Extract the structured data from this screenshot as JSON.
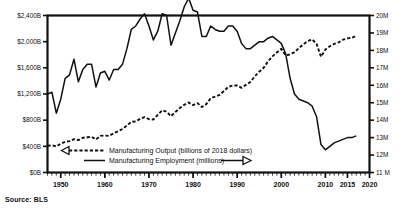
{
  "figure": {
    "source_note": "Source: BLS"
  },
  "chart_data": {
    "type": "line",
    "title": "",
    "xlabel": "",
    "ylabel": "",
    "grid": false,
    "legend_position": "inside-bottom",
    "xlim": [
      1947,
      2020
    ],
    "x_ticks": [
      "1950",
      "1960",
      "1970",
      "1980",
      "1990",
      "2000",
      "2010",
      "2015",
      "2020"
    ],
    "x_tick_values": [
      1950,
      1960,
      1970,
      1980,
      1990,
      2000,
      2010,
      2015,
      2020
    ],
    "minor_x_tick_interval": 1,
    "axes": [
      {
        "id": "left",
        "label_suffix": "B",
        "ylim": [
          0,
          2400
        ],
        "ticks": [
          "$0B",
          "$400B",
          "$800B",
          "$1,200B",
          "$1,600B",
          "$2,000B",
          "$2,400B"
        ],
        "tick_values": [
          0,
          400,
          800,
          1200,
          1600,
          2000,
          2400
        ]
      },
      {
        "id": "right",
        "label_suffix": "M",
        "ylim": [
          11,
          20
        ],
        "ticks": [
          "11 M",
          "12M",
          "13M",
          "14M",
          "15M",
          "16M",
          "17M",
          "18M",
          "19M",
          "20M"
        ],
        "tick_values": [
          11,
          12,
          13,
          14,
          15,
          16,
          17,
          18,
          19,
          20
        ]
      }
    ],
    "series": [
      {
        "name": "Manufacturing Output (billions of 2018 dollars)",
        "axis": "left",
        "style": "dashed",
        "arrow": "left",
        "x": [
          1947,
          1948,
          1949,
          1950,
          1951,
          1952,
          1953,
          1954,
          1955,
          1956,
          1957,
          1958,
          1959,
          1960,
          1961,
          1962,
          1963,
          1964,
          1965,
          1966,
          1967,
          1968,
          1969,
          1970,
          1971,
          1972,
          1973,
          1974,
          1975,
          1976,
          1977,
          1978,
          1979,
          1980,
          1981,
          1982,
          1983,
          1984,
          1985,
          1986,
          1987,
          1988,
          1989,
          1990,
          1991,
          1992,
          1993,
          1994,
          1995,
          1996,
          1997,
          1998,
          1999,
          2000,
          2001,
          2002,
          2003,
          2004,
          2005,
          2006,
          2007,
          2008,
          2009,
          2010,
          2011,
          2012,
          2013,
          2014,
          2015,
          2016,
          2017
        ],
        "values": [
          410,
          415,
          400,
          440,
          470,
          480,
          510,
          495,
          530,
          540,
          545,
          505,
          560,
          565,
          560,
          600,
          630,
          665,
          720,
          775,
          780,
          820,
          845,
          815,
          810,
          880,
          950,
          930,
          860,
          925,
          985,
          1035,
          1070,
          1030,
          1060,
          1000,
          1045,
          1135,
          1160,
          1185,
          1245,
          1310,
          1330,
          1330,
          1295,
          1340,
          1385,
          1470,
          1540,
          1600,
          1700,
          1775,
          1835,
          1890,
          1790,
          1805,
          1840,
          1900,
          1960,
          2010,
          2035,
          1965,
          1770,
          1880,
          1930,
          1965,
          1990,
          2030,
          2050,
          2060,
          2090
        ]
      },
      {
        "name": "Manufacturing Employment (millions)",
        "axis": "right",
        "style": "solid",
        "arrow": "right",
        "x": [
          1947,
          1948,
          1949,
          1950,
          1951,
          1952,
          1953,
          1954,
          1955,
          1956,
          1957,
          1958,
          1959,
          1960,
          1961,
          1962,
          1963,
          1964,
          1965,
          1966,
          1967,
          1968,
          1969,
          1970,
          1971,
          1972,
          1973,
          1974,
          1975,
          1976,
          1977,
          1978,
          1979,
          1980,
          1981,
          1982,
          1983,
          1984,
          1985,
          1986,
          1987,
          1988,
          1989,
          1990,
          1991,
          1992,
          1993,
          1994,
          1995,
          1996,
          1997,
          1998,
          1999,
          2000,
          2001,
          2002,
          2003,
          2004,
          2005,
          2006,
          2007,
          2008,
          2009,
          2010,
          2011,
          2012,
          2013,
          2014,
          2015,
          2016,
          2017
        ],
        "values": [
          15.5,
          15.6,
          14.4,
          15.2,
          16.4,
          16.6,
          17.5,
          16.2,
          16.9,
          17.2,
          17.2,
          15.9,
          16.7,
          16.8,
          16.3,
          16.9,
          16.9,
          17.2,
          18.1,
          19.2,
          19.4,
          19.8,
          20.1,
          19.4,
          18.6,
          19.1,
          20.1,
          20.0,
          18.3,
          19.0,
          19.7,
          20.5,
          21.0,
          20.3,
          20.2,
          18.8,
          18.8,
          19.4,
          19.2,
          19.1,
          19.1,
          19.4,
          19.4,
          19.1,
          18.4,
          18.1,
          18.1,
          18.3,
          18.5,
          18.5,
          18.7,
          18.8,
          18.6,
          18.4,
          17.8,
          16.4,
          15.5,
          15.2,
          15.1,
          15.0,
          14.8,
          14.2,
          12.6,
          12.3,
          12.5,
          12.7,
          12.8,
          12.9,
          13.0,
          13.0,
          13.1
        ]
      }
    ]
  }
}
